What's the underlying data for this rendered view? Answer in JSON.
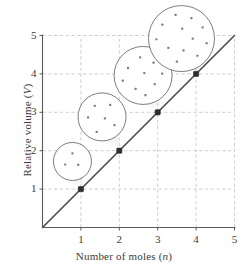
{
  "chart_data": {
    "type": "line",
    "title": "",
    "subtitle": "",
    "xlabel_prefix": "Number of moles (",
    "xlabel_var": "n",
    "xlabel_suffix": ")",
    "ylabel_prefix": "Relative volume (",
    "ylabel_var": "V",
    "ylabel_suffix": ")",
    "x": [
      1,
      2,
      3,
      4
    ],
    "y": [
      1,
      2,
      3,
      4
    ],
    "series": [
      {
        "name": "Volume vs moles",
        "values": [
          1,
          2,
          3,
          4
        ]
      }
    ],
    "xlim": [
      0,
      5
    ],
    "ylim": [
      0,
      5
    ],
    "xticks": [
      1,
      2,
      3,
      4,
      5
    ],
    "xtick_labels": [
      "1",
      "2",
      "3",
      "4",
      "5"
    ],
    "yticks": [
      1,
      2,
      3,
      4,
      5
    ],
    "ytick_labels": [
      "1",
      "2",
      "3",
      "4",
      "5"
    ],
    "grid": true,
    "grid_style": "dashed",
    "legend": null,
    "line_color": "#4a4a4a",
    "grid_color": "#b9b9b9",
    "axis_color": "#5a5a5a",
    "marker_color": "#2e2e2e",
    "bubble_stroke_color": "#6e6e6e",
    "bubble_fill_color": "#ffffff",
    "dot_color": "#808080",
    "line_through_origin": true,
    "annotations": [
      {
        "at_x": 1,
        "at_y": 1,
        "label": "molecule-bubble-1",
        "particle_count": 3
      },
      {
        "at_x": 2,
        "at_y": 2,
        "label": "molecule-bubble-2",
        "particle_count": 6
      },
      {
        "at_x": 3,
        "at_y": 3,
        "label": "molecule-bubble-3",
        "particle_count": 9
      },
      {
        "at_x": 4,
        "at_y": 4,
        "label": "molecule-bubble-4",
        "particle_count": 12
      }
    ],
    "bubbles": [
      {
        "id": 1,
        "cx_data": 0.78,
        "cy_data": 1.72,
        "r_px": 19,
        "particles": [
          [
            0.0,
            -0.42
          ],
          [
            -0.38,
            0.16
          ],
          [
            0.3,
            0.18
          ]
        ]
      },
      {
        "id": 2,
        "cx_data": 1.55,
        "cy_data": 2.88,
        "r_px": 24,
        "particles": [
          [
            -0.3,
            -0.46
          ],
          [
            0.34,
            -0.5
          ],
          [
            -0.58,
            0.02
          ],
          [
            0.12,
            0.06
          ],
          [
            0.52,
            0.34
          ],
          [
            -0.22,
            0.62
          ]
        ]
      },
      {
        "id": 3,
        "cx_data": 2.62,
        "cy_data": 3.96,
        "r_px": 29,
        "particles": [
          [
            -0.1,
            -0.62
          ],
          [
            0.36,
            -0.44
          ],
          [
            -0.52,
            -0.26
          ],
          [
            0.66,
            -0.06
          ],
          [
            0.04,
            -0.08
          ],
          [
            -0.7,
            0.18
          ],
          [
            0.4,
            0.3
          ],
          [
            -0.26,
            0.46
          ],
          [
            0.08,
            0.68
          ]
        ]
      },
      {
        "id": 4,
        "cx_data": 3.62,
        "cy_data": 4.92,
        "r_px": 33,
        "particles": [
          [
            -0.18,
            -0.72
          ],
          [
            0.3,
            -0.62
          ],
          [
            -0.58,
            -0.42
          ],
          [
            0.64,
            -0.34
          ],
          [
            0.02,
            -0.3
          ],
          [
            -0.76,
            0.02
          ],
          [
            0.34,
            0.0
          ],
          [
            0.76,
            0.14
          ],
          [
            -0.4,
            0.28
          ],
          [
            0.06,
            0.36
          ],
          [
            0.48,
            0.52
          ],
          [
            -0.14,
            0.7
          ]
        ]
      }
    ]
  }
}
